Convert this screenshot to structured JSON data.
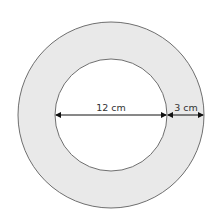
{
  "diagram": {
    "type": "annulus",
    "outer_circle": {
      "cx": 111,
      "cy": 115,
      "r": 93
    },
    "inner_circle": {
      "cx": 111,
      "cy": 115,
      "r": 56
    },
    "colors": {
      "ring_fill": "#e9e9e9",
      "inner_fill": "#ffffff",
      "stroke": "#6f6f6f",
      "arrow": "#111111"
    },
    "labels": {
      "inner_diameter": "12 cm",
      "ring_width": "3 cm"
    }
  }
}
